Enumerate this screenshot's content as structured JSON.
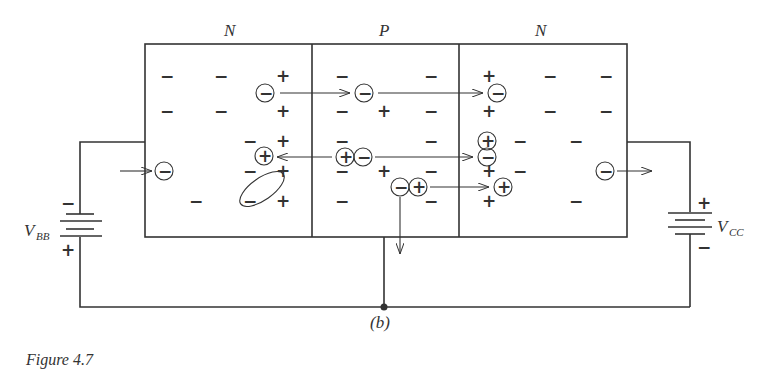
{
  "regions": [
    {
      "label": "N",
      "name": "emitter"
    },
    {
      "label": "P",
      "name": "base"
    },
    {
      "label": "N",
      "name": "collector"
    }
  ],
  "batteries": {
    "left": {
      "label": "V",
      "subscript": "BB",
      "top_sign": "−",
      "bottom_sign": "+"
    },
    "right": {
      "label": "V",
      "subscript": "CC",
      "top_sign": "+",
      "bottom_sign": "−"
    }
  },
  "carrier_glyphs": {
    "electron": "−",
    "hole": "+"
  },
  "subfigure_label": "(b)",
  "caption": "Figure 4.7",
  "colors": {
    "ink": "#333333",
    "background": "#ffffff"
  }
}
